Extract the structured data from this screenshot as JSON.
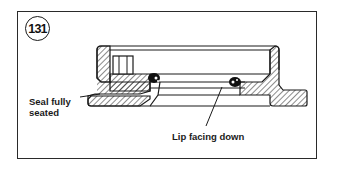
{
  "figure": {
    "number": "131"
  },
  "labels": {
    "seal_line1": "Seal fully",
    "seal_line2": "seated",
    "lip": "Lip facing down"
  },
  "colors": {
    "ink": "#1a1a1a",
    "background": "#ffffff"
  }
}
